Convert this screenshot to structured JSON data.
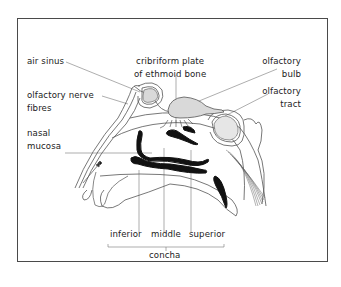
{
  "diagram": {
    "type": "anatomical cross-section of the nose (olfactory system)",
    "labels": {
      "air_sinus": "air sinus",
      "cribriform_line1": "cribriform plate",
      "cribriform_line2": "of ethmoid bone",
      "olfactory_bulb_line1": "olfactory",
      "olfactory_bulb_line2": "bulb",
      "olfactory_tract_line1": "olfactory",
      "olfactory_tract_line2": "tract",
      "olfactory_nerve_line1": "olfactory nerve",
      "olfactory_nerve_line2": "fibres",
      "nasal_mucosa_line1": "nasal",
      "nasal_mucosa_line2": "mucosa",
      "concha_inferior": "inferior",
      "concha_middle": "middle",
      "concha_superior": "superior",
      "concha_group": "concha"
    },
    "colors": {
      "border": "#4a4a4a",
      "line": "#555555",
      "fill_gray": "#d9d9d9",
      "concha_black": "#111111"
    }
  }
}
